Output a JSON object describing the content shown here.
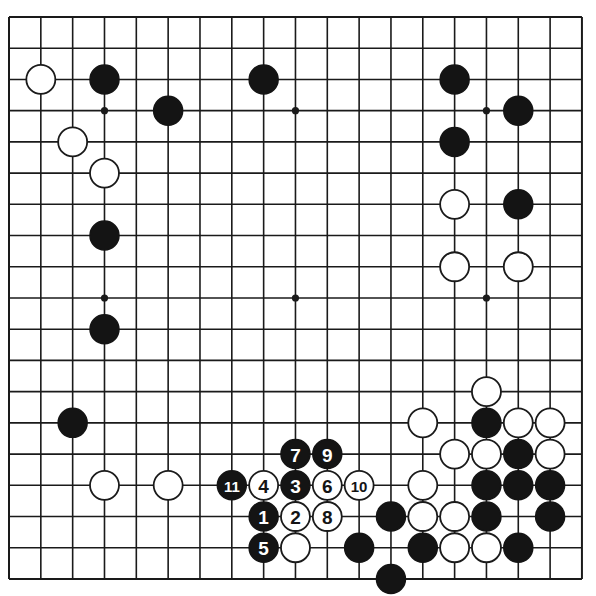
{
  "diagram": {
    "type": "go-board",
    "size": 19,
    "colors": {
      "black": "#141414",
      "white": "#ffffff",
      "line": "#1a1a1a",
      "background": "#ffffff"
    },
    "geometry": {
      "x0": 9,
      "y0": 17,
      "dx": 31.83,
      "dy": 31.22,
      "stone_radius": 14.5
    },
    "star_points": [
      [
        3,
        3
      ],
      [
        9,
        3
      ],
      [
        15,
        3
      ],
      [
        3,
        9
      ],
      [
        9,
        9
      ],
      [
        15,
        9
      ],
      [
        3,
        15
      ],
      [
        9,
        15
      ],
      [
        15,
        15
      ]
    ],
    "stones": [
      {
        "color": "white",
        "col": 1,
        "row": 2
      },
      {
        "color": "black",
        "col": 3,
        "row": 2
      },
      {
        "color": "black",
        "col": 8,
        "row": 2
      },
      {
        "color": "black",
        "col": 5,
        "row": 3
      },
      {
        "color": "white",
        "col": 2,
        "row": 4
      },
      {
        "color": "white",
        "col": 3,
        "row": 5
      },
      {
        "color": "black",
        "col": 3,
        "row": 7
      },
      {
        "color": "black",
        "col": 3,
        "row": 10
      },
      {
        "color": "black",
        "col": 2,
        "row": 13
      },
      {
        "color": "white",
        "col": 3,
        "row": 15
      },
      {
        "color": "white",
        "col": 5,
        "row": 15
      },
      {
        "color": "black",
        "col": 14,
        "row": 2
      },
      {
        "color": "black",
        "col": 16,
        "row": 3
      },
      {
        "color": "black",
        "col": 14,
        "row": 4
      },
      {
        "color": "white",
        "col": 14,
        "row": 6
      },
      {
        "color": "black",
        "col": 16,
        "row": 6
      },
      {
        "color": "white",
        "col": 14,
        "row": 8
      },
      {
        "color": "white",
        "col": 16,
        "row": 8
      },
      {
        "color": "white",
        "col": 15,
        "row": 12
      },
      {
        "color": "white",
        "col": 13,
        "row": 13
      },
      {
        "color": "black",
        "col": 15,
        "row": 13
      },
      {
        "color": "white",
        "col": 16,
        "row": 13
      },
      {
        "color": "white",
        "col": 17,
        "row": 13
      },
      {
        "color": "white",
        "col": 14,
        "row": 14
      },
      {
        "color": "white",
        "col": 15,
        "row": 14
      },
      {
        "color": "black",
        "col": 16,
        "row": 14
      },
      {
        "color": "white",
        "col": 17,
        "row": 14
      },
      {
        "color": "white",
        "col": 13,
        "row": 15
      },
      {
        "color": "black",
        "col": 15,
        "row": 15
      },
      {
        "color": "black",
        "col": 16,
        "row": 15
      },
      {
        "color": "black",
        "col": 17,
        "row": 15
      },
      {
        "color": "black",
        "col": 12,
        "row": 16
      },
      {
        "color": "white",
        "col": 13,
        "row": 16
      },
      {
        "color": "white",
        "col": 14,
        "row": 16
      },
      {
        "color": "black",
        "col": 15,
        "row": 16
      },
      {
        "color": "black",
        "col": 17,
        "row": 16
      },
      {
        "color": "black",
        "col": 11,
        "row": 17
      },
      {
        "color": "black",
        "col": 13,
        "row": 17
      },
      {
        "color": "white",
        "col": 14,
        "row": 17
      },
      {
        "color": "white",
        "col": 15,
        "row": 17
      },
      {
        "color": "black",
        "col": 16,
        "row": 17
      },
      {
        "color": "black",
        "col": 12,
        "row": 18
      },
      {
        "color": "white",
        "col": 9,
        "row": 17
      }
    ],
    "numbered_moves": [
      {
        "n": "1",
        "color": "black",
        "col": 8,
        "row": 16
      },
      {
        "n": "2",
        "color": "white",
        "col": 9,
        "row": 16
      },
      {
        "n": "3",
        "color": "black",
        "col": 9,
        "row": 15
      },
      {
        "n": "4",
        "color": "white",
        "col": 8,
        "row": 15
      },
      {
        "n": "5",
        "color": "black",
        "col": 8,
        "row": 17
      },
      {
        "n": "6",
        "color": "white",
        "col": 10,
        "row": 15
      },
      {
        "n": "7",
        "color": "black",
        "col": 9,
        "row": 14
      },
      {
        "n": "8",
        "color": "white",
        "col": 10,
        "row": 16
      },
      {
        "n": "9",
        "color": "black",
        "col": 10,
        "row": 14
      },
      {
        "n": "10",
        "color": "white",
        "col": 11,
        "row": 15
      },
      {
        "n": "11",
        "color": "black",
        "col": 7,
        "row": 15
      }
    ]
  }
}
